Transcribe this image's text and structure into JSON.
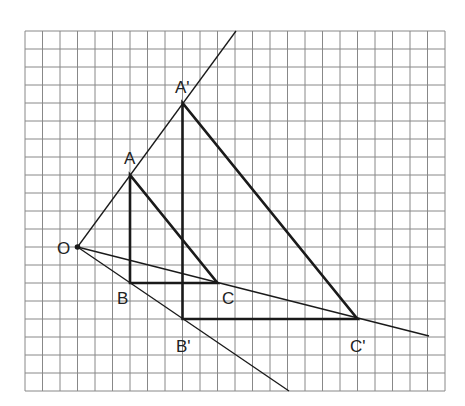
{
  "diagram": {
    "type": "homothety-on-grid",
    "grid": {
      "cols": 24,
      "rows": 20,
      "origin_px": [
        25,
        31
      ],
      "cell_w": 17.5,
      "cell_h": 18,
      "line_color": "#888888"
    },
    "center": {
      "name": "O",
      "label": "O",
      "pos": [
        3,
        12
      ]
    },
    "scale_factor": 2,
    "triangle_original": {
      "vertices": [
        {
          "name": "A",
          "label": "A",
          "pos": [
            6,
            8
          ]
        },
        {
          "name": "B",
          "label": "B",
          "pos": [
            6,
            14
          ]
        },
        {
          "name": "C",
          "label": "C",
          "pos": [
            11,
            14
          ]
        }
      ]
    },
    "triangle_image": {
      "vertices": [
        {
          "name": "A'",
          "label": "A'",
          "pos": [
            9,
            4
          ]
        },
        {
          "name": "B'",
          "label": "B'",
          "pos": [
            9,
            16
          ]
        },
        {
          "name": "C'",
          "label": "C'",
          "pos": [
            19,
            16
          ]
        }
      ]
    },
    "rays": [
      {
        "name": "ray-OA",
        "from": "O",
        "to_px": [
          236,
          31
        ]
      },
      {
        "name": "ray-OB",
        "from": "O",
        "to_px": [
          289,
          391
        ]
      },
      {
        "name": "ray-OC",
        "from": "O",
        "to_px": [
          429,
          336
        ]
      }
    ],
    "colors": {
      "stroke": "#1a1a1a",
      "grid": "#888888",
      "text": "#222222"
    }
  }
}
